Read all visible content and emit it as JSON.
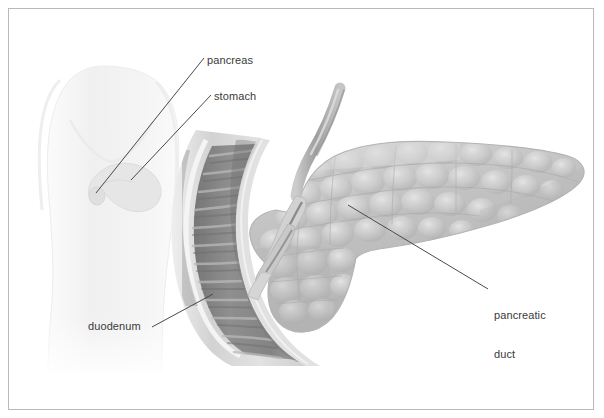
{
  "figure": {
    "border_color": "#b9b9b9",
    "background": "#ffffff"
  },
  "labels": {
    "pancreas": "pancreas",
    "stomach": "stomach",
    "duodenum": "duodenum",
    "pancreatic_duct_line1": "pancreatic",
    "pancreatic_duct_line2": "duct"
  },
  "structures": [
    {
      "name": "body-silhouette",
      "description": "faint grayscale human torso outline, front view, left side of figure",
      "color": "#f1f1f1"
    },
    {
      "name": "inset-stomach",
      "description": "small pale stomach and pancreas shown inside the torso",
      "color": "#e3e3e3"
    },
    {
      "name": "duodenum",
      "description": "C-shaped duodenal loop, cut open, showing circular mucosal folds",
      "wall_color": "#cfcfcf",
      "lumen_color": "#8c8c8c",
      "fold_color": "#d8d8d8"
    },
    {
      "name": "pancreas",
      "description": "lobulated pancreas with head, body and tapering tail extending right",
      "tissue_color": "#c3c3c3",
      "lobule_highlight": "#dadada"
    },
    {
      "name": "common-bile-duct",
      "description": "tube descending from upper area into the pancreatic head",
      "color": "#a8a8a8"
    },
    {
      "name": "ampulla",
      "description": "duct opening into the duodenal wall (papilla)",
      "color": "#bdbdbd"
    }
  ],
  "leader_lines": [
    {
      "name": "leader-pancreas",
      "from": [
        204,
        58
      ],
      "to": [
        96,
        193
      ]
    },
    {
      "name": "leader-stomach",
      "from": [
        211,
        95
      ],
      "to": [
        131,
        180
      ]
    },
    {
      "name": "leader-duodenum",
      "from": [
        152,
        327
      ],
      "to": [
        213,
        294
      ]
    },
    {
      "name": "leader-pancreatic-duct",
      "from": [
        488,
        289
      ],
      "to": [
        348,
        205
      ]
    }
  ],
  "line_color": "#4a4a4a"
}
